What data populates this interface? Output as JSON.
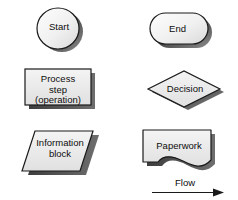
{
  "diagram": {
    "background_color": "#ffffff",
    "shape_fill_light": "#f2f2f2",
    "shape_fill_mid": "#e2e2e2",
    "shape_fill_dark": "#cfcfcf",
    "outline_color": "#1a1a1a",
    "shadow_color": "#3a3a3a",
    "text_color": "#0d0d0d"
  },
  "symbols": {
    "start": {
      "label": "Start",
      "shape": "circle",
      "icon": "terminator-start-icon"
    },
    "end": {
      "label": "End",
      "shape": "stadium",
      "icon": "terminator-end-icon"
    },
    "process": {
      "label": "Process\nstep\n(operation)",
      "line1": "Process",
      "line2": "step",
      "line3": "(operation)",
      "shape": "rectangle",
      "icon": "process-step-icon"
    },
    "decision": {
      "label": "Decision",
      "shape": "diamond",
      "icon": "decision-icon"
    },
    "information": {
      "label": "Information\nblock",
      "line1": "Information",
      "line2": "block",
      "shape": "parallelogram",
      "icon": "information-block-icon"
    },
    "paperwork": {
      "label": "Paperwork",
      "shape": "document",
      "icon": "paperwork-document-icon"
    }
  },
  "flow_arrow": {
    "label": "Flow",
    "icon": "arrow-right-icon",
    "direction": "right"
  }
}
